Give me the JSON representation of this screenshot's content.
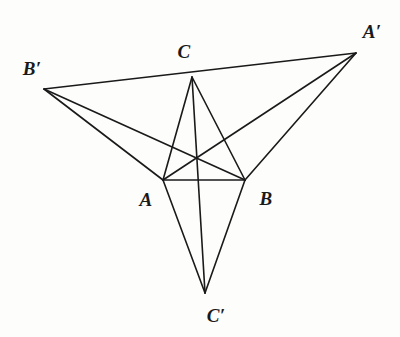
{
  "figure": {
    "background_color": "#fdfdfc",
    "stroke_color": "#1a1a1a",
    "stroke_width": 1.6,
    "width": 400,
    "height": 337
  },
  "points": {
    "A": {
      "label": "A",
      "x": 163,
      "y": 180,
      "label_x": 146,
      "label_y": 199
    },
    "B": {
      "label": "B",
      "x": 245,
      "y": 180,
      "label_x": 266,
      "label_y": 198
    },
    "C": {
      "label": "C",
      "x": 192,
      "y": 77,
      "label_x": 184,
      "label_y": 51
    },
    "Ap": {
      "label": "A′",
      "x": 356,
      "y": 53,
      "label_x": 372,
      "label_y": 31
    },
    "Bp": {
      "label": "B′",
      "x": 44,
      "y": 89,
      "label_x": 32,
      "label_y": 68
    },
    "Cp": {
      "label": "C′",
      "x": 205,
      "y": 293,
      "label_x": 216,
      "label_y": 315
    },
    "O": {
      "label": "",
      "x": 196,
      "y": 159,
      "label_x": 196,
      "label_y": 159
    }
  },
  "segments": [
    {
      "name": "segment-B-prime-to-A-prime",
      "from": "Bp",
      "to": "Ap",
      "note": "passes through C"
    },
    {
      "name": "segment-A-to-B",
      "from": "A",
      "to": "B"
    },
    {
      "name": "segment-C-to-A",
      "from": "C",
      "to": "A"
    },
    {
      "name": "segment-C-to-B",
      "from": "C",
      "to": "B"
    },
    {
      "name": "segment-C-to-C-prime",
      "from": "C",
      "to": "Cp"
    },
    {
      "name": "segment-A-to-C-prime",
      "from": "A",
      "to": "Cp"
    },
    {
      "name": "segment-B-to-C-prime",
      "from": "B",
      "to": "Cp"
    },
    {
      "name": "segment-A-to-A-prime",
      "from": "A",
      "to": "Ap"
    },
    {
      "name": "segment-B-to-A-prime",
      "from": "B",
      "to": "Ap"
    },
    {
      "name": "segment-B-to-B-prime",
      "from": "B",
      "to": "Bp"
    },
    {
      "name": "segment-A-to-B-prime",
      "from": "A",
      "to": "Bp"
    }
  ],
  "labels": {
    "A": "A",
    "B": "B",
    "C": "C",
    "A_prime": "A′",
    "B_prime": "B′",
    "C_prime": "C′"
  }
}
